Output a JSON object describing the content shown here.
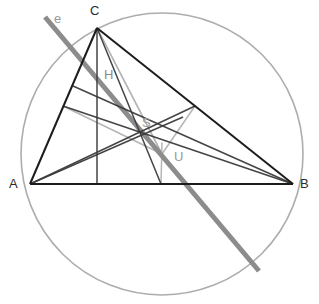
{
  "figure": {
    "width": 319,
    "height": 304,
    "background": "#ffffff"
  },
  "colors": {
    "triangle": "#1c1c1c",
    "cevian": "#3a3a3a",
    "euler_line": "#8c8c8c",
    "circumcircle": "#adadad",
    "bisector": "#b5b5b5",
    "label_dark": "#2b2b2b",
    "label_grey": "#9a9a9a"
  },
  "points": {
    "A": {
      "label": "A",
      "x": 30,
      "y": 184,
      "label_x": 9,
      "label_y": 177
    },
    "B": {
      "label": "B",
      "x": 293,
      "y": 184,
      "label_x": 300,
      "label_y": 177
    },
    "C": {
      "label": "C",
      "x": 97,
      "y": 28,
      "label_x": 90,
      "label_y": 4
    },
    "H": {
      "label": "H",
      "x": 97,
      "y": 82,
      "label_x": 104,
      "label_y": 68
    },
    "S": {
      "label": "S",
      "x": 140,
      "y": 132,
      "label_x": 142,
      "label_y": 116
    },
    "U": {
      "label": "U",
      "x": 162,
      "y": 154,
      "label_x": 174,
      "label_y": 150
    },
    "Ma": {
      "label": "",
      "x": 195,
      "y": 106
    },
    "Mb": {
      "label": "",
      "x": 63,
      "y": 106
    },
    "Mc": {
      "label": "",
      "x": 161,
      "y": 184
    },
    "Fc": {
      "label": "",
      "x": 97,
      "y": 184
    },
    "Fa": {
      "label": "",
      "x": 183,
      "y": 117
    },
    "Fb": {
      "label": "",
      "x": 73,
      "y": 86
    }
  },
  "euler_line": {
    "name": "e",
    "label": "e",
    "label_x": 54,
    "label_y": 12,
    "x1": 45,
    "y1": 17,
    "x2": 259,
    "y2": 271,
    "stroke_width": 5
  },
  "circumcircle": {
    "cx": 162,
    "cy": 154,
    "r": 141,
    "stroke_width": 1.6
  },
  "segments": [
    {
      "name": "side-AB",
      "x1": 30,
      "y1": 184,
      "x2": 293,
      "y2": 184,
      "style": "triangle"
    },
    {
      "name": "side-AC",
      "x1": 30,
      "y1": 184,
      "x2": 97,
      "y2": 28,
      "style": "triangle"
    },
    {
      "name": "side-CB",
      "x1": 97,
      "y1": 28,
      "x2": 293,
      "y2": 184,
      "style": "triangle"
    },
    {
      "name": "altitude-from-C",
      "x1": 97,
      "y1": 28,
      "x2": 97,
      "y2": 184,
      "style": "cevian"
    },
    {
      "name": "altitude-from-A",
      "x1": 30,
      "y1": 184,
      "x2": 183,
      "y2": 117,
      "style": "cevian"
    },
    {
      "name": "altitude-from-B",
      "x1": 293,
      "y1": 184,
      "x2": 73,
      "y2": 86,
      "style": "cevian"
    },
    {
      "name": "median-from-C",
      "x1": 97,
      "y1": 28,
      "x2": 161,
      "y2": 184,
      "style": "cevian"
    },
    {
      "name": "median-from-A",
      "x1": 30,
      "y1": 184,
      "x2": 195,
      "y2": 106,
      "style": "cevian"
    },
    {
      "name": "median-from-B",
      "x1": 293,
      "y1": 184,
      "x2": 63,
      "y2": 106,
      "style": "cevian"
    },
    {
      "name": "perp-bisector-AB",
      "x1": 161,
      "y1": 184,
      "x2": 162,
      "y2": 143,
      "style": "bisector"
    },
    {
      "name": "perp-bisector-CB",
      "x1": 195,
      "y1": 106,
      "x2": 162,
      "y2": 154,
      "style": "bisector"
    },
    {
      "name": "perp-bisector-AC",
      "x1": 63,
      "y1": 106,
      "x2": 162,
      "y2": 154,
      "style": "bisector"
    },
    {
      "name": "circumradius-UC",
      "x1": 162,
      "y1": 154,
      "x2": 97,
      "y2": 28,
      "style": "bisector"
    },
    {
      "name": "segment-C-to-U",
      "x1": 97,
      "y1": 28,
      "x2": 162,
      "y2": 154,
      "style": "bisector"
    }
  ]
}
